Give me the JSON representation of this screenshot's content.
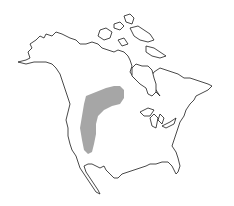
{
  "map": {
    "type": "range-map",
    "region": "North America",
    "background_color": "#ffffff",
    "outline_color": "#1a1a1a",
    "range": {
      "label": "range-shaded-area",
      "fill_color": "#a6a6a6",
      "description": "Gray shaded region over the western Great Plains / northern Rockies, extending northeast into the Canadian prairies"
    }
  }
}
